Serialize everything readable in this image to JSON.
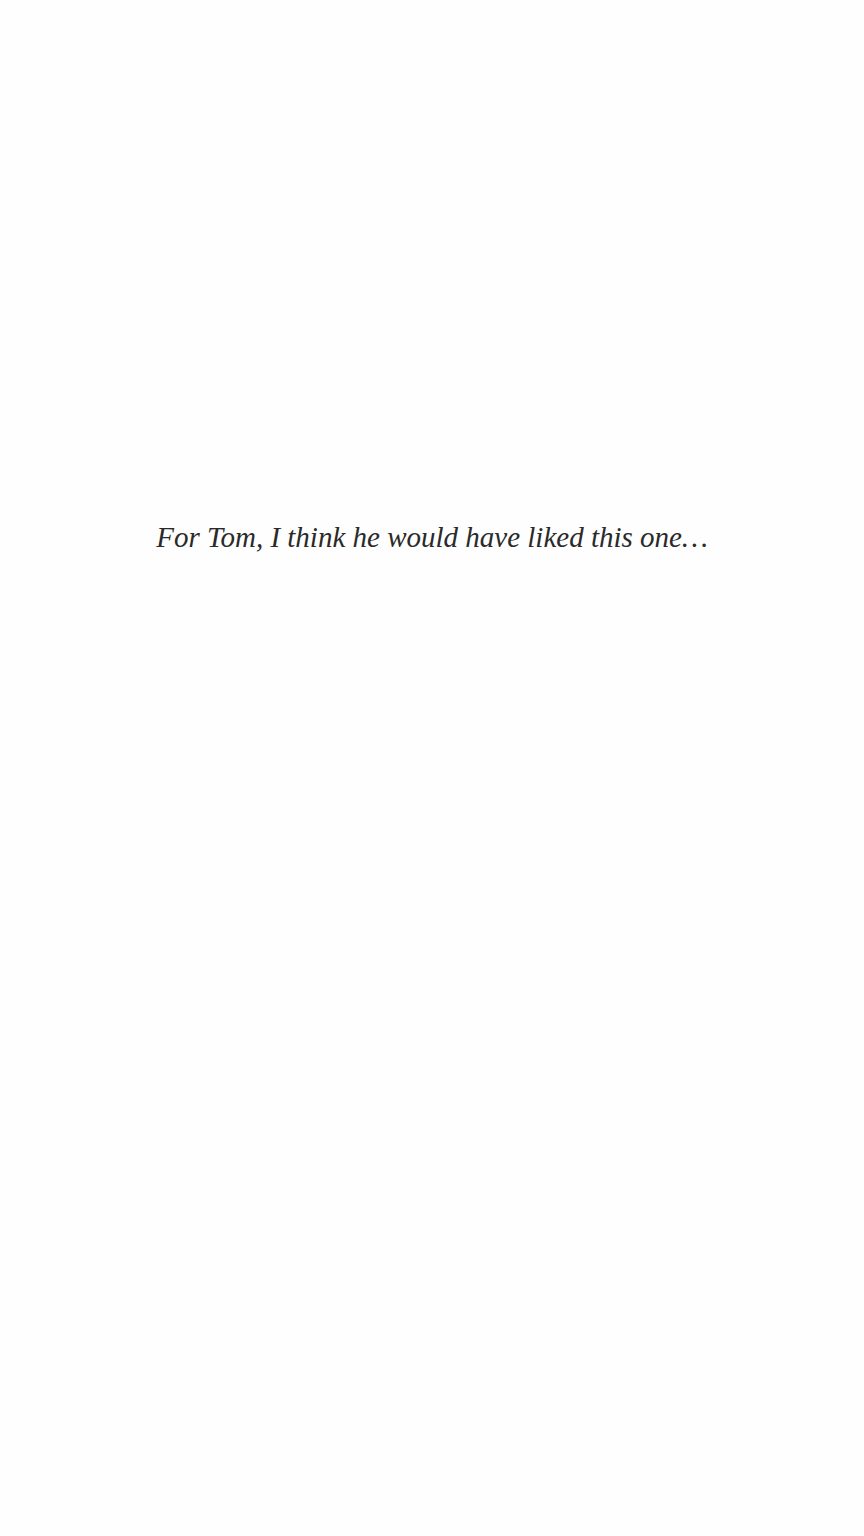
{
  "page": {
    "dedication": "For Tom, I think he would have liked this one…"
  }
}
